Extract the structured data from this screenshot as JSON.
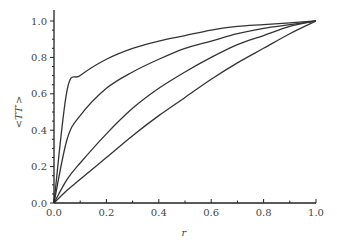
{
  "chart_data": {
    "type": "line",
    "title": "",
    "xlabel": "r",
    "ylabel": "<TT′>",
    "xlim": [
      0.0,
      1.0
    ],
    "ylim": [
      0.0,
      1.0
    ],
    "grid": false,
    "legend": null,
    "x_ticks": [
      "0.0",
      "0.2",
      "0.4",
      "0.6",
      "0.8",
      "1.0"
    ],
    "y_ticks": [
      "0.0",
      "0.2",
      "0.4",
      "0.6",
      "0.8",
      "1.0"
    ],
    "x": [
      0,
      0.05,
      0.1,
      0.2,
      0.3,
      0.4,
      0.5,
      0.6,
      0.7,
      0.8,
      0.9,
      1.0
    ],
    "series": [
      {
        "name": "curve-1",
        "values": [
          0,
          0.62,
          0.7,
          0.79,
          0.85,
          0.89,
          0.92,
          0.95,
          0.97,
          0.98,
          0.99,
          1.0
        ]
      },
      {
        "name": "curve-2",
        "values": [
          0,
          0.35,
          0.48,
          0.63,
          0.72,
          0.79,
          0.85,
          0.89,
          0.93,
          0.96,
          0.98,
          1.0
        ]
      },
      {
        "name": "curve-3",
        "values": [
          0,
          0.13,
          0.22,
          0.38,
          0.52,
          0.63,
          0.72,
          0.8,
          0.87,
          0.92,
          0.97,
          1.0
        ]
      },
      {
        "name": "curve-4",
        "values": [
          0,
          0.07,
          0.13,
          0.25,
          0.37,
          0.48,
          0.58,
          0.68,
          0.77,
          0.85,
          0.93,
          1.0
        ]
      }
    ],
    "colors": {
      "line": "#333333",
      "axis": "#222222",
      "text": "#444444"
    }
  }
}
